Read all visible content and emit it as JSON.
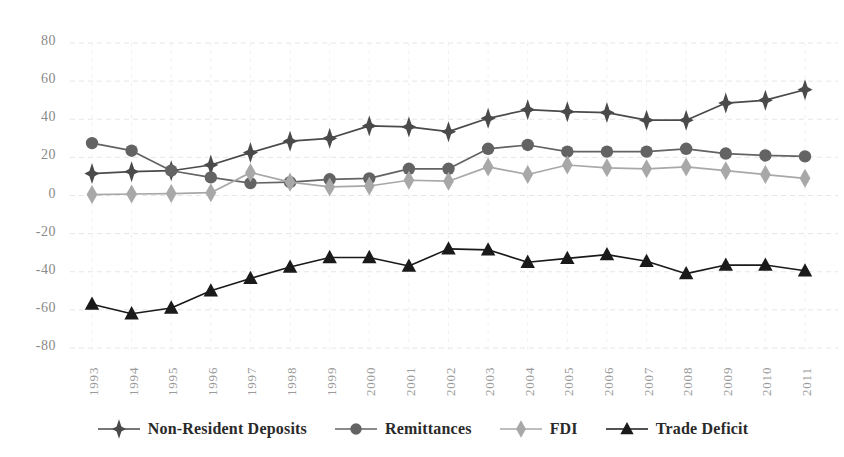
{
  "chart_data": {
    "type": "line",
    "title": "",
    "subtitle": "",
    "xlabel": "",
    "ylabel": "",
    "grid": true,
    "legend_position": "bottom",
    "categories": [
      "1993",
      "1994",
      "1995",
      "1996",
      "1997",
      "1998",
      "1999",
      "2000",
      "2001",
      "2002",
      "2003",
      "2004",
      "2005",
      "2006",
      "2007",
      "2008",
      "2009",
      "2010",
      "2011"
    ],
    "x": [
      "1993",
      "1994",
      "1995",
      "1996",
      "1997",
      "1998",
      "1999",
      "2000",
      "2001",
      "2002",
      "2003",
      "2004",
      "2005",
      "2006",
      "2007",
      "2008",
      "2009",
      "2010",
      "2011"
    ],
    "ylim": [
      -80,
      80
    ],
    "yticks": [
      80,
      60,
      40,
      20,
      0,
      -20,
      -40,
      -60,
      -80
    ],
    "ytick_labels": [
      "80",
      "60",
      "40",
      "20",
      "0",
      "-20",
      "-40",
      "-60",
      "-80"
    ],
    "series": [
      {
        "name": "Non-Resident Deposits",
        "marker": "diamond-star",
        "color": "#4a4a4a",
        "values": [
          11.5,
          12.5,
          13.0,
          16.0,
          22.5,
          28.5,
          30.0,
          36.5,
          36.0,
          33.5,
          40.5,
          45.0,
          44.0,
          43.5,
          39.5,
          39.5,
          48.5,
          50.0,
          55.5
        ]
      },
      {
        "name": "Remittances",
        "marker": "circle",
        "color": "#636363",
        "values": [
          27.5,
          23.5,
          13.0,
          9.5,
          6.5,
          7.0,
          8.5,
          9.0,
          14.0,
          14.0,
          24.5,
          26.5,
          23.0,
          23.0,
          23.0,
          24.5,
          22.0,
          21.0,
          20.5
        ]
      },
      {
        "name": "FDI",
        "marker": "diamond",
        "color": "#a8a8a8",
        "values": [
          0.5,
          0.8,
          1.0,
          1.5,
          12.0,
          7.0,
          4.5,
          5.0,
          8.0,
          7.5,
          15.0,
          11.0,
          16.0,
          14.5,
          14.0,
          15.0,
          13.0,
          11.0,
          9.0
        ]
      },
      {
        "name": "Trade Deficit",
        "marker": "triangle",
        "color": "#1a1a1a",
        "values": [
          -57.0,
          -62.0,
          -59.0,
          -50.0,
          -43.5,
          -37.5,
          -32.5,
          -32.5,
          -37.0,
          -28.0,
          -28.5,
          -35.0,
          -33.0,
          -31.0,
          -34.5,
          -41.0,
          -36.5,
          -36.5,
          -39.5
        ]
      }
    ]
  },
  "legend": {
    "items": [
      {
        "label": "Non-Resident Deposits",
        "marker": "diamond-star",
        "color": "#4a4a4a"
      },
      {
        "label": "Remittances",
        "marker": "circle",
        "color": "#636363"
      },
      {
        "label": "FDI",
        "marker": "diamond",
        "color": "#a8a8a8"
      },
      {
        "label": "Trade Deficit",
        "marker": "triangle",
        "color": "#1a1a1a"
      }
    ]
  },
  "axes": {
    "gridline_color": "#e6e6e6",
    "ytick_color": "#8a8a8a",
    "xtick_color": "#9a9a9a"
  }
}
